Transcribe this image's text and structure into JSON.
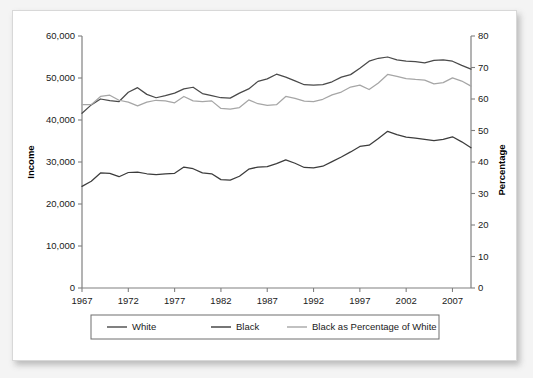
{
  "chart_data": {
    "type": "line",
    "title": "",
    "subtitle": "",
    "xlabel": "",
    "ylabel": "Income",
    "y2label": "Percentage",
    "xlim": [
      1967,
      2009
    ],
    "ylim": [
      0,
      60000
    ],
    "y2lim": [
      0,
      80
    ],
    "grid": false,
    "legend_position": "bottom",
    "x_tick_labels": [
      "1967",
      "1972",
      "1977",
      "1982",
      "1987",
      "1992",
      "1997",
      "2002",
      "2007"
    ],
    "x_ticks": [
      1967,
      1972,
      1977,
      1982,
      1987,
      1992,
      1997,
      2002,
      2007
    ],
    "y_tick_labels": [
      "0",
      "10,000",
      "20,000",
      "30,000",
      "40,000",
      "50,000",
      "60,000"
    ],
    "y_ticks": [
      0,
      10000,
      20000,
      30000,
      40000,
      50000,
      60000
    ],
    "y2_tick_labels": [
      "0",
      "10",
      "20",
      "30",
      "40",
      "50",
      "60",
      "70",
      "80"
    ],
    "y2_ticks": [
      0,
      10,
      20,
      30,
      40,
      50,
      60,
      70,
      80
    ],
    "x": [
      1967,
      1968,
      1969,
      1970,
      1971,
      1972,
      1973,
      1974,
      1975,
      1976,
      1977,
      1978,
      1979,
      1980,
      1981,
      1982,
      1983,
      1984,
      1985,
      1986,
      1987,
      1988,
      1989,
      1990,
      1991,
      1992,
      1993,
      1994,
      1995,
      1996,
      1997,
      1998,
      1999,
      2000,
      2001,
      2002,
      2003,
      2004,
      2005,
      2006,
      2007,
      2008,
      2009
    ],
    "series": [
      {
        "name": "White",
        "axis": "left",
        "color": "#4a4a4a",
        "units": "dollars",
        "values": [
          41600,
          43600,
          45000,
          44600,
          44400,
          46600,
          47700,
          46100,
          45300,
          45800,
          46400,
          47400,
          47800,
          46300,
          45800,
          45300,
          45200,
          46400,
          47400,
          49200,
          49800,
          50900,
          50200,
          49300,
          48400,
          48300,
          48400,
          49100,
          50200,
          50800,
          52300,
          54000,
          54700,
          55000,
          54300,
          54000,
          53900,
          53600,
          54200,
          54300,
          54000,
          53000,
          52100
        ]
      },
      {
        "name": "Black",
        "axis": "left",
        "color": "#3c3c3c",
        "units": "dollars",
        "values": [
          24200,
          25400,
          27400,
          27300,
          26500,
          27500,
          27600,
          27200,
          27000,
          27200,
          27300,
          28800,
          28400,
          27400,
          27200,
          25800,
          25700,
          26600,
          28300,
          28800,
          28900,
          29600,
          30500,
          29700,
          28700,
          28600,
          29000,
          30100,
          31200,
          32400,
          33700,
          34000,
          35600,
          37300,
          36500,
          35900,
          35700,
          35400,
          35100,
          35400,
          36000,
          34800,
          33400
        ]
      },
      {
        "name": "Black as Percentage of White",
        "axis": "right",
        "color": "#a6a6a6",
        "units": "percent",
        "values": [
          58.2,
          58.2,
          60.8,
          61.2,
          59.6,
          59.0,
          57.8,
          59.0,
          59.6,
          59.4,
          58.8,
          60.8,
          59.4,
          59.2,
          59.4,
          57.0,
          56.8,
          57.3,
          59.7,
          58.5,
          58.0,
          58.2,
          60.8,
          60.2,
          59.3,
          59.2,
          59.9,
          61.3,
          62.2,
          63.8,
          64.4,
          63.0,
          65.1,
          67.8,
          67.2,
          66.5,
          66.2,
          66.0,
          64.8,
          65.2,
          66.7,
          65.7,
          64.1
        ]
      }
    ]
  },
  "legend": {
    "items": [
      {
        "label": "White",
        "color": "#4a4a4a"
      },
      {
        "label": "Black",
        "color": "#3c3c3c"
      },
      {
        "label": "Black as Percentage of White",
        "color": "#a6a6a6"
      }
    ]
  },
  "axes": {
    "left_title": "Income",
    "right_title": "Percentage"
  }
}
